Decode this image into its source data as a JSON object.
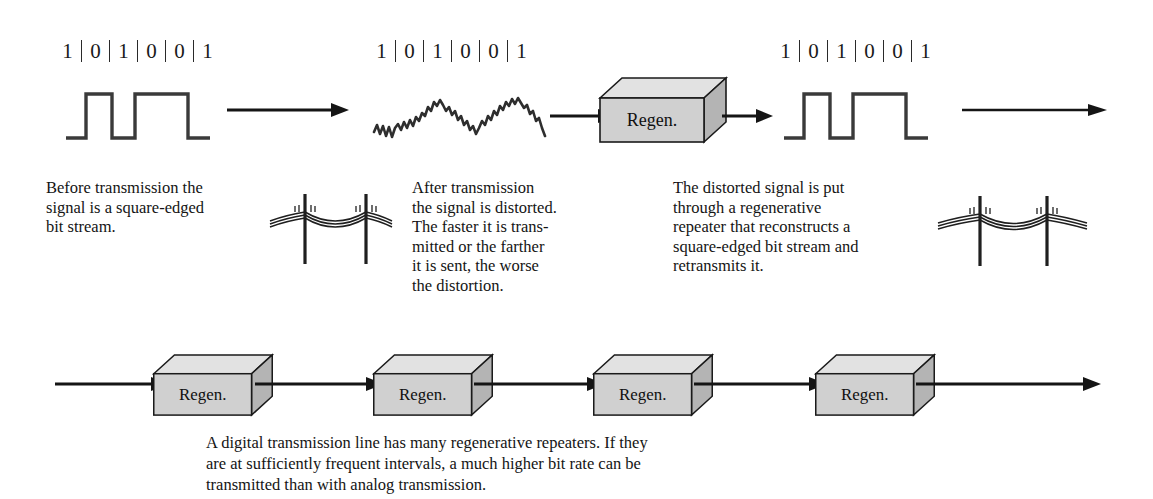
{
  "figure": {
    "type": "diagram"
  },
  "bit_stream": {
    "bits": [
      "1",
      "0",
      "1",
      "0",
      "0",
      "1"
    ],
    "separator": "|"
  },
  "stages": {
    "clean_signal_before": {
      "label_bits": [
        "1",
        "0",
        "1",
        "0",
        "0",
        "1"
      ],
      "waveform": "square"
    },
    "distorted_signal": {
      "label_bits": [
        "1",
        "0",
        "1",
        "0",
        "0",
        "1"
      ],
      "waveform": "noisy-distorted"
    },
    "regenerated_signal": {
      "label_bits": [
        "1",
        "0",
        "1",
        "0",
        "0",
        "1"
      ],
      "waveform": "square"
    }
  },
  "regen_boxes": {
    "label": "Regen.",
    "top_row_count": 1,
    "bottom_row_count": 4,
    "face_color": "#d0d0d0",
    "top_color": "#e2e2e2",
    "side_color": "#b4b4b4",
    "stroke_color": "#1a1a1a"
  },
  "captions": {
    "before": {
      "lines": [
        "Before transmission the",
        "signal is a square-edged",
        "bit stream."
      ]
    },
    "after": {
      "lines": [
        "After transmission",
        "the signal is distorted.",
        "The faster it is trans-",
        "mitted or the farther",
        "it is sent, the worse",
        "the distortion."
      ]
    },
    "repeater": {
      "lines": [
        "The distorted signal is put",
        "through a regenerative",
        "repeater that reconstructs a",
        "square-edged bit stream and",
        "retransmits it."
      ]
    },
    "bottom": {
      "lines": [
        "A digital transmission line has many regenerative repeaters. If they",
        "are at sufficiently frequent intervals, a much higher bit rate can be",
        "transmitted than with analog transmission."
      ]
    }
  },
  "icons": {
    "telephone_pole_left": "telephone-pole-lines-icon",
    "telephone_pole_right": "telephone-pole-lines-icon",
    "arrow": "arrow-right-icon"
  },
  "colors": {
    "ink": "#1a1a1a",
    "background": "#ffffff",
    "box_face": "#d0d0d0"
  }
}
